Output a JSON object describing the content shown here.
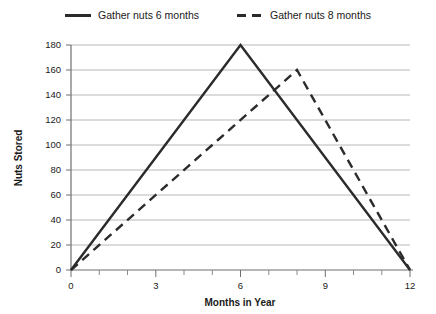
{
  "chart_data": {
    "type": "line",
    "title": "",
    "xlabel": "Months in Year",
    "ylabel": "Nuts Stored",
    "xlim": [
      0,
      12
    ],
    "ylim": [
      0,
      180
    ],
    "grid": "horizontal",
    "legend_position": "top-center",
    "x_ticks": [
      0,
      3,
      6,
      9,
      12
    ],
    "x_tick_labels": [
      "0",
      "3",
      "6",
      "9",
      "12"
    ],
    "x_minor_step": 1,
    "y_ticks": [
      0,
      20,
      40,
      60,
      80,
      100,
      120,
      140,
      160,
      180
    ],
    "y_tick_labels": [
      "0",
      "20",
      "40",
      "60",
      "80",
      "100",
      "120",
      "140",
      "160",
      "180"
    ],
    "series": [
      {
        "name": "Gather nuts 6 months",
        "style": "solid",
        "color": "#2b2b2b",
        "x": [
          0,
          6,
          12
        ],
        "values": [
          0,
          180,
          0
        ],
        "peak_month": 6,
        "peak_value": 180
      },
      {
        "name": "Gather nuts 8 months",
        "style": "dashed",
        "color": "#2b2b2b",
        "x": [
          0,
          8,
          12
        ],
        "values": [
          0,
          160,
          0
        ],
        "peak_month": 8,
        "peak_value": 160
      }
    ]
  },
  "legend": {
    "items": [
      {
        "label": "Gather nuts 6 months",
        "style": "solid"
      },
      {
        "label": "Gather nuts 8 months",
        "style": "dashed"
      }
    ]
  },
  "axes": {
    "x_title": "Months in Year",
    "y_title": "Nuts Stored"
  },
  "colors": {
    "line": "#2b2b2b",
    "gridline": "#b8b8b8",
    "axis": "#6f6f6f",
    "background": "#ffffff",
    "text": "#1a1a1a"
  }
}
